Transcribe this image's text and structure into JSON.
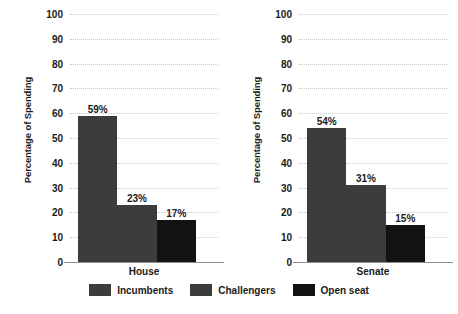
{
  "chart_data": {
    "type": "bar",
    "title": "",
    "subtitle": "",
    "xlabel": "",
    "ylabel": "Percentage of Spending",
    "ylim": [
      0,
      100
    ],
    "ytick_labels": [
      "100",
      "90",
      "80",
      "70",
      "60",
      "50",
      "40",
      "30",
      "20",
      "10",
      "0"
    ],
    "ytick_values": [
      100,
      90,
      80,
      70,
      60,
      50,
      40,
      30,
      20,
      10,
      0
    ],
    "grid": true,
    "grid_style": "dotted-horizontal",
    "legend_position": "bottom-center",
    "categories": [
      "House",
      "Senate"
    ],
    "series": [
      {
        "name": "Incumbents",
        "values": [
          59,
          54
        ],
        "color": "#3c3c3c"
      },
      {
        "name": "Challengers",
        "values": [
          23,
          31
        ],
        "color": "#3c3c3c"
      },
      {
        "name": "Open seat",
        "values": [
          17,
          15
        ],
        "color": "#121212"
      }
    ],
    "panels": [
      {
        "category": "House",
        "ylabel": "Percentage of Spending",
        "bars": [
          {
            "series": "Incumbents",
            "value": 59,
            "label": "59%",
            "color": "#3c3c3c"
          },
          {
            "series": "Challengers",
            "value": 23,
            "label": "23%",
            "color": "#3c3c3c"
          },
          {
            "series": "Open seat",
            "value": 17,
            "label": "17%",
            "color": "#121212"
          }
        ]
      },
      {
        "category": "Senate",
        "ylabel": "Percentage of Spending",
        "bars": [
          {
            "series": "Incumbents",
            "value": 54,
            "label": "54%",
            "color": "#3c3c3c"
          },
          {
            "series": "Challengers",
            "value": 31,
            "label": "31%",
            "color": "#3c3c3c"
          },
          {
            "series": "Open seat",
            "value": 15,
            "label": "15%",
            "color": "#121212"
          }
        ]
      }
    ],
    "legend": [
      {
        "label": "Incumbents",
        "color": "#3c3c3c"
      },
      {
        "label": "Challengers",
        "color": "#3c3c3c"
      },
      {
        "label": "Open seat",
        "color": "#121212"
      }
    ]
  },
  "colors": {
    "background": "#ffffff",
    "bar_gray": "#3c3c3c",
    "bar_black": "#121212",
    "gridline": "#c9c9c9",
    "axis": "#8d8d8d",
    "text": "#1a1a1a"
  }
}
